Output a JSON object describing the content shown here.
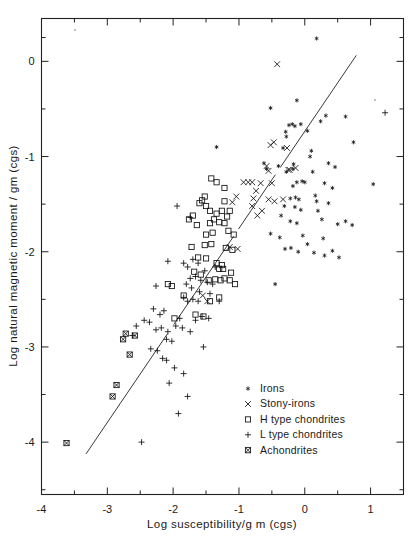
{
  "chart_data": {
    "type": "scatter",
    "title": "",
    "xlabel": "Log susceptibility/g m  (cgs)",
    "ylabel": "Log natural  magnetic  moment / gm (cgs)",
    "xlim": [
      -4,
      1.5
    ],
    "ylim": [
      -4.55,
      0.45
    ],
    "xticks": [
      -4,
      -3,
      -2,
      -1,
      0,
      1
    ],
    "xticklabels": [
      "-4",
      "-3",
      "-2",
      "-1",
      "0",
      "1"
    ],
    "yticks": [
      0,
      -1,
      -2,
      -3,
      -4
    ],
    "yticklabels": [
      "0",
      "-1",
      "-2",
      "-3",
      "-4"
    ],
    "minor_ticks": true,
    "grid": false,
    "legend_position": "lower-right",
    "trendline": {
      "label": "regression line",
      "x0": -3.32,
      "y0": -4.12,
      "x1": 0.78,
      "y1": 0.06,
      "style": "solid-segmented"
    },
    "series": [
      {
        "name": "Irons",
        "marker": "star",
        "points": [
          [
            0.18,
            0.24
          ],
          [
            -0.52,
            -0.49
          ],
          [
            -0.12,
            -0.41
          ],
          [
            0.32,
            -0.57
          ],
          [
            0.62,
            -0.58
          ],
          [
            -0.24,
            -0.67
          ],
          [
            -0.19,
            -0.66
          ],
          [
            -0.15,
            -0.68
          ],
          [
            -0.06,
            -0.66
          ],
          [
            0.74,
            -0.85
          ],
          [
            -0.28,
            -0.79
          ],
          [
            -0.29,
            -0.74
          ],
          [
            0.04,
            -0.73
          ],
          [
            -0.33,
            -0.91
          ],
          [
            0.1,
            -0.94
          ],
          [
            -1.34,
            -0.9
          ],
          [
            -0.62,
            -1.07
          ],
          [
            -0.4,
            -1.1
          ],
          [
            -0.17,
            -1.08
          ],
          [
            -0.18,
            -1.13
          ],
          [
            0.36,
            -1.07
          ],
          [
            0.46,
            -1.11
          ],
          [
            0.12,
            -1.16
          ],
          [
            -0.28,
            -1.16
          ],
          [
            1.04,
            -1.29
          ],
          [
            -0.12,
            -1.27
          ],
          [
            -0.04,
            -1.26
          ],
          [
            0.0,
            -1.27
          ],
          [
            0.3,
            -1.28
          ],
          [
            -0.18,
            -1.31
          ],
          [
            0.42,
            -1.33
          ],
          [
            -0.22,
            -1.44
          ],
          [
            -0.14,
            -1.43
          ],
          [
            -0.09,
            -1.45
          ],
          [
            0.16,
            -1.41
          ],
          [
            0.18,
            -1.47
          ],
          [
            0.36,
            -1.49
          ],
          [
            -0.31,
            -1.52
          ],
          [
            -0.15,
            -1.53
          ],
          [
            -0.06,
            -1.56
          ],
          [
            0.2,
            -1.57
          ],
          [
            -0.22,
            -1.68
          ],
          [
            -0.12,
            -1.7
          ],
          [
            0.26,
            -1.66
          ],
          [
            0.5,
            -1.71
          ],
          [
            0.62,
            -1.68
          ],
          [
            0.72,
            -1.72
          ],
          [
            -0.52,
            -1.81
          ],
          [
            -0.38,
            -1.85
          ],
          [
            -0.03,
            -1.83
          ],
          [
            0.28,
            -1.86
          ],
          [
            0.04,
            -1.92
          ],
          [
            -0.3,
            -1.97
          ],
          [
            -0.21,
            -1.96
          ],
          [
            0.14,
            -2.01
          ],
          [
            0.42,
            -1.99
          ],
          [
            0.3,
            -2.04
          ],
          [
            -0.45,
            -2.34
          ],
          [
            0.52,
            -2.06
          ],
          [
            -0.1,
            -2.0
          ],
          [
            -0.58,
            -1.13
          ],
          [
            0.24,
            -0.63
          ],
          [
            0.08,
            -1.0
          ],
          [
            -0.36,
            -1.62
          ]
        ]
      },
      {
        "name": "Stony-irons",
        "marker": "cross-x",
        "points": [
          [
            -0.42,
            -0.03
          ],
          [
            -0.47,
            -0.85
          ],
          [
            -0.52,
            -0.88
          ],
          [
            -0.27,
            -0.91
          ],
          [
            -0.58,
            -1.1
          ],
          [
            -0.55,
            -1.15
          ],
          [
            -0.23,
            -1.14
          ],
          [
            -0.14,
            -1.12
          ],
          [
            -0.93,
            -1.27
          ],
          [
            -0.86,
            -1.27
          ],
          [
            -0.8,
            -1.27
          ],
          [
            -0.67,
            -1.28
          ],
          [
            -0.5,
            -1.28
          ],
          [
            -0.74,
            -1.36
          ],
          [
            -0.78,
            -1.44
          ],
          [
            -0.8,
            -1.52
          ],
          [
            -0.55,
            -1.45
          ],
          [
            -0.46,
            -1.47
          ],
          [
            -0.65,
            -1.57
          ],
          [
            -0.72,
            -1.62
          ],
          [
            -1.04,
            -1.42
          ],
          [
            -1.1,
            -1.48
          ],
          [
            -1.14,
            -1.95
          ],
          [
            -1.02,
            -1.97
          ],
          [
            -1.55,
            -2.46
          ],
          [
            -1.48,
            -2.52
          ],
          [
            -0.25,
            -1.14
          ],
          [
            -0.33,
            -1.45
          ]
        ]
      },
      {
        "name": "H type chondrites",
        "marker": "square",
        "points": [
          [
            -1.42,
            -1.23
          ],
          [
            -1.34,
            -1.27
          ],
          [
            -1.22,
            -1.33
          ],
          [
            -1.52,
            -1.42
          ],
          [
            -1.56,
            -1.46
          ],
          [
            -1.5,
            -1.52
          ],
          [
            -1.6,
            -1.49
          ],
          [
            -1.22,
            -1.47
          ],
          [
            -1.7,
            -1.62
          ],
          [
            -1.76,
            -1.66
          ],
          [
            -1.44,
            -1.57
          ],
          [
            -1.34,
            -1.6
          ],
          [
            -1.26,
            -1.57
          ],
          [
            -1.14,
            -1.57
          ],
          [
            -1.18,
            -1.63
          ],
          [
            -1.64,
            -1.72
          ],
          [
            -1.44,
            -1.7
          ],
          [
            -1.38,
            -1.66
          ],
          [
            -1.3,
            -1.69
          ],
          [
            -1.22,
            -1.7
          ],
          [
            -1.5,
            -1.82
          ],
          [
            -1.4,
            -1.8
          ],
          [
            -1.16,
            -1.78
          ],
          [
            -1.08,
            -1.82
          ],
          [
            -1.52,
            -1.93
          ],
          [
            -1.42,
            -1.92
          ],
          [
            -1.2,
            -1.96
          ],
          [
            -1.1,
            -1.98
          ],
          [
            -1.62,
            -2.06
          ],
          [
            -1.5,
            -2.07
          ],
          [
            -1.34,
            -2.12
          ],
          [
            -1.26,
            -2.14
          ],
          [
            -1.3,
            -2.18
          ],
          [
            -1.24,
            -2.18
          ],
          [
            -1.68,
            -2.21
          ],
          [
            -1.58,
            -2.24
          ],
          [
            -1.46,
            -2.3
          ],
          [
            -1.36,
            -2.29
          ],
          [
            -1.22,
            -2.28
          ],
          [
            -1.14,
            -2.3
          ],
          [
            -1.06,
            -2.34
          ],
          [
            -2.08,
            -2.34
          ],
          [
            -2.02,
            -2.36
          ],
          [
            -1.3,
            -2.48
          ],
          [
            -1.44,
            -2.52
          ],
          [
            -1.84,
            -2.46
          ],
          [
            -1.66,
            -2.66
          ],
          [
            -1.54,
            -2.68
          ],
          [
            -1.98,
            -2.7
          ],
          [
            -1.28,
            -2.3
          ],
          [
            -1.12,
            -2.22
          ],
          [
            -1.72,
            -1.95
          ]
        ]
      },
      {
        "name": "L type chondrites",
        "marker": "plus",
        "points": [
          [
            1.22,
            -0.54
          ],
          [
            -1.94,
            -1.52
          ],
          [
            -1.74,
            -1.64
          ],
          [
            -2.08,
            -2.1
          ],
          [
            -2.26,
            -2.36
          ],
          [
            -1.84,
            -2.12
          ],
          [
            -1.78,
            -2.16
          ],
          [
            -1.7,
            -2.08
          ],
          [
            -1.62,
            -2.12
          ],
          [
            -1.52,
            -2.2
          ],
          [
            -1.36,
            -2.16
          ],
          [
            -1.74,
            -2.28
          ],
          [
            -1.66,
            -2.26
          ],
          [
            -1.58,
            -2.3
          ],
          [
            -1.48,
            -2.32
          ],
          [
            -1.4,
            -2.34
          ],
          [
            -1.8,
            -2.34
          ],
          [
            -1.72,
            -2.38
          ],
          [
            -1.84,
            -2.48
          ],
          [
            -1.78,
            -2.52
          ],
          [
            -1.7,
            -2.5
          ],
          [
            -1.62,
            -2.52
          ],
          [
            -2.3,
            -2.6
          ],
          [
            -2.2,
            -2.66
          ],
          [
            -2.14,
            -2.62
          ],
          [
            -2.44,
            -2.72
          ],
          [
            -2.36,
            -2.74
          ],
          [
            -1.9,
            -2.7
          ],
          [
            -1.66,
            -2.72
          ],
          [
            -1.56,
            -2.68
          ],
          [
            -1.46,
            -2.7
          ],
          [
            -2.56,
            -2.78
          ],
          [
            -2.26,
            -2.82
          ],
          [
            -2.18,
            -2.8
          ],
          [
            -2.08,
            -2.84
          ],
          [
            -1.96,
            -2.78
          ],
          [
            -1.86,
            -2.8
          ],
          [
            -1.74,
            -2.84
          ],
          [
            -2.1,
            -2.92
          ],
          [
            -2.02,
            -2.94
          ],
          [
            -2.34,
            -3.02
          ],
          [
            -2.24,
            -3.04
          ],
          [
            -1.54,
            -3.0
          ],
          [
            -2.16,
            -3.12
          ],
          [
            -2.1,
            -3.14
          ],
          [
            -1.98,
            -3.22
          ],
          [
            -1.84,
            -3.28
          ],
          [
            -2.06,
            -3.38
          ],
          [
            -1.78,
            -3.52
          ],
          [
            -1.92,
            -3.7
          ],
          [
            -2.48,
            -4.0
          ],
          [
            -1.3,
            -2.52
          ],
          [
            -1.6,
            -2.42
          ],
          [
            -1.44,
            -2.44
          ],
          [
            -2.62,
            -2.88
          ]
        ]
      },
      {
        "name": "Achondrites",
        "marker": "crossed-square",
        "points": [
          [
            -2.72,
            -2.86
          ],
          [
            -2.76,
            -2.92
          ],
          [
            -2.58,
            -2.88
          ],
          [
            -2.66,
            -3.08
          ],
          [
            -2.86,
            -3.4
          ],
          [
            -2.92,
            -3.52
          ],
          [
            -3.62,
            -4.01
          ]
        ]
      }
    ]
  },
  "legend": {
    "items": [
      {
        "label": "Irons",
        "marker": "star"
      },
      {
        "label": "Stony-irons",
        "marker": "cross-x"
      },
      {
        "label": "H type chondrites",
        "marker": "square"
      },
      {
        "label": "L type chondrites",
        "marker": "plus"
      },
      {
        "label": "Achondrites",
        "marker": "crossed-square"
      }
    ]
  },
  "colors": {
    "ink": "#1a1a1a",
    "frame": "#222222",
    "trendline": "#3a3a3a",
    "background": "#ffffff"
  }
}
